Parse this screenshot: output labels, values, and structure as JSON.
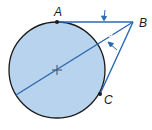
{
  "diagram": {
    "type": "geometry",
    "colors": {
      "circle_fill": "#b8d3ee",
      "circle_stroke": "#1a1a1a",
      "line": "#2a68b0",
      "point": "#1a1a1a",
      "label": "#1a1a1a",
      "angle_label": "#ffffff"
    },
    "points": {
      "A": {
        "label": "A"
      },
      "B": {
        "label": "B"
      },
      "C": {
        "label": "C"
      }
    },
    "angle_label": "∠1",
    "center_mark": "+"
  }
}
